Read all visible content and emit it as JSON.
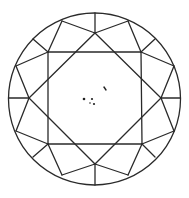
{
  "diagram": {
    "type": "diamond-clarity-plot",
    "view": "crown (top view)",
    "shape": "round brilliant",
    "colors": {
      "line": "#2a2a2a",
      "inclusion": "#222222",
      "background": "#ffffff"
    },
    "girdle": {
      "cx": 94.5,
      "cy": 99,
      "r": 86
    },
    "table_corners": [
      [
        48,
        52
      ],
      [
        141,
        52
      ],
      [
        142,
        144
      ],
      [
        48,
        144
      ]
    ],
    "star_points": [
      [
        95,
        33
      ],
      [
        161,
        98
      ],
      [
        95,
        164
      ],
      [
        29,
        98
      ]
    ],
    "inclusions": [
      {
        "type": "crystal",
        "x": 84,
        "y": 99
      },
      {
        "type": "crystal",
        "x": 92,
        "y": 99
      },
      {
        "type": "crystal",
        "x": 90,
        "y": 103
      },
      {
        "type": "crystal",
        "x": 94,
        "y": 104
      },
      {
        "type": "feather",
        "x": 105,
        "y": 88
      }
    ]
  }
}
